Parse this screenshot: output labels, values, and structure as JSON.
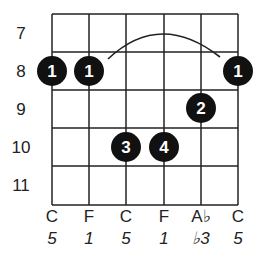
{
  "chord": {
    "frets": [
      "7",
      "8",
      "9",
      "10",
      "11"
    ],
    "notes": [
      "C",
      "F",
      "C",
      "F",
      "A♭",
      "C"
    ],
    "intervals": [
      "5",
      "1",
      "5",
      "1",
      "♭3",
      "5"
    ],
    "barre": {
      "fret": "8",
      "from_string": 1,
      "to_string": 6
    },
    "dots": [
      {
        "string": 1,
        "fret_row": 1,
        "finger": "1"
      },
      {
        "string": 2,
        "fret_row": 1,
        "finger": "1"
      },
      {
        "string": 6,
        "fret_row": 1,
        "finger": "1"
      },
      {
        "string": 5,
        "fret_row": 2,
        "finger": "2"
      },
      {
        "string": 3,
        "fret_row": 3,
        "finger": "3"
      },
      {
        "string": 4,
        "fret_row": 3,
        "finger": "4"
      }
    ]
  }
}
